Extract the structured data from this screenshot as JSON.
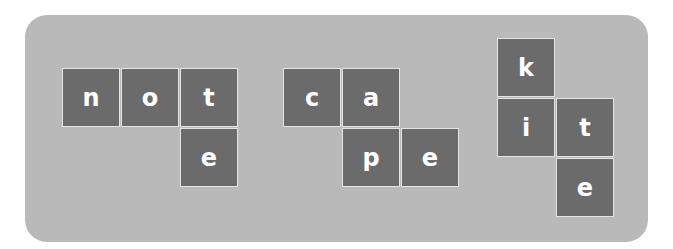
{
  "words": [
    {
      "word": "note",
      "tiles": [
        "n",
        "o",
        "t",
        "e"
      ]
    },
    {
      "word": "cape",
      "tiles": [
        "c",
        "a",
        "p",
        "e"
      ]
    },
    {
      "word": "kite",
      "tiles": [
        "k",
        "i",
        "t",
        "e"
      ]
    }
  ],
  "colors": {
    "panel": "#b9b9b9",
    "tile": "#6b6b6b",
    "letter": "#ffffff",
    "tile_border": "#e4e4e4"
  }
}
